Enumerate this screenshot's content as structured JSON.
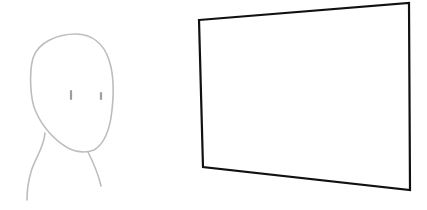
{
  "illustration": {
    "background": "#ffffff",
    "figure": {
      "label": "person-figure",
      "stroke": "#bdbdbd",
      "stroke_width": 1.6
    },
    "frame": {
      "label": "blank-screen-frame",
      "stroke": "#111111",
      "stroke_width": 2.2,
      "corners": {
        "top_left": [
          199,
          20
        ],
        "top_right": [
          409,
          3
        ],
        "bottom_right": [
          410,
          190
        ],
        "bottom_left": [
          203,
          167
        ]
      }
    }
  }
}
